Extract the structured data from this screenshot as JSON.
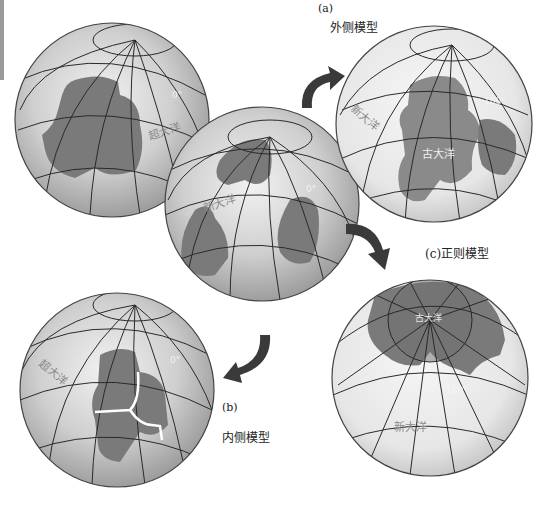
{
  "labels": {
    "outer_model": "外侧模型",
    "part_a": "(a)",
    "inner_model": "内侧模型",
    "part_b": "(b)",
    "orthogonal_model": "(c)正则模型"
  },
  "globes": {
    "top_left": {
      "ocean_label": "超大洋",
      "meridian_label": "0°"
    },
    "center": {
      "ocean_label": "新大洋",
      "meridian_label": "0°"
    },
    "top_right": {
      "new_ocean_label": "新大洋",
      "old_ocean_label": "古大洋",
      "meridian_label": "180°"
    },
    "bottom_left": {
      "ocean_label": "超大洋",
      "meridian_label": "0°"
    },
    "bottom_right": {
      "old_ocean_label": "古大洋",
      "new_ocean_label": "新大洋",
      "meridian_label": "180°"
    }
  },
  "colors": {
    "globe_light": "#e8e8e8",
    "globe_mid": "#bdbdbd",
    "continent": "#7a7a7a",
    "grid_line": "#2a2a2a",
    "arrow": "#3a3a3a",
    "rift": "#ffffff"
  }
}
